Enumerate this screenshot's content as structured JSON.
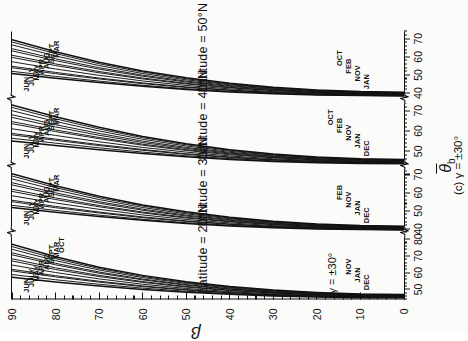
{
  "figure": {
    "caption": "(c)  γ = ±30°",
    "xaxis_title_theta": "θ",
    "xaxis_title_sub": "b",
    "yaxis_title_beta": "β",
    "gamma_note": "γ = ±30°"
  },
  "beta_axis": {
    "label": "β",
    "min": 0,
    "max": 90,
    "ticks": [
      0,
      10,
      20,
      30,
      40,
      50,
      60,
      70,
      80,
      90
    ],
    "tick_labels": [
      "0",
      "10",
      "20",
      "30",
      "40",
      "50",
      "60",
      "70",
      "80",
      "90"
    ],
    "minor_step": 2
  },
  "panels": [
    {
      "id": "panel-lat-20",
      "title": "Latitude = 20°N",
      "gamma": "γ = ±30°",
      "theta_min": 44,
      "theta_max": 84,
      "theta_ticks": [
        50,
        60,
        70,
        80
      ],
      "theta_tick_labels": [
        "50",
        "60",
        "70",
        "80"
      ],
      "theta_minor_step": 2,
      "month_labels_top": [
        "JUN",
        "JULY",
        "MAY",
        "APR",
        "AUG",
        "SEPT",
        "MAR",
        "OCT"
      ],
      "month_labels_bottom": [
        "DEC",
        "JAN",
        "NOV"
      ]
    },
    {
      "id": "panel-lat-30",
      "title": "Latitude = 30°N",
      "theta_min": 38,
      "theta_max": 75,
      "theta_ticks": [
        40,
        50,
        60,
        70
      ],
      "theta_tick_labels": [
        "40",
        "50",
        "60",
        "70"
      ],
      "theta_minor_step": 2,
      "month_labels_top": [
        "JUN",
        "JULY",
        "MAY",
        "APR",
        "AUG",
        "SEPT",
        "MAR"
      ],
      "month_labels_bottom": [
        "DEC",
        "JAN",
        "NOV",
        "FEB"
      ]
    },
    {
      "id": "panel-lat-40",
      "title": "Latitude = 40°N",
      "theta_min": 43,
      "theta_max": 76,
      "theta_ticks": [
        50,
        60,
        70
      ],
      "theta_tick_labels": [
        "50",
        "60",
        "70"
      ],
      "theta_minor_step": 2,
      "month_labels_top": [
        "JUN",
        "JULY",
        "MAY",
        "APR",
        "AUG",
        "SEPT",
        "MAR"
      ],
      "month_labels_bottom": [
        "DEC",
        "JAN",
        "NOV",
        "FEB",
        "OCT"
      ]
    },
    {
      "id": "panel-lat-50",
      "title": "Latitude = 50°N",
      "theta_min": 37,
      "theta_max": 74,
      "theta_ticks": [
        40,
        50,
        60,
        70
      ],
      "theta_tick_labels": [
        "40",
        "50",
        "60",
        "70"
      ],
      "theta_minor_step": 2,
      "month_labels_top": [
        "JUN",
        "JULY",
        "MAY",
        "APR",
        "AUG",
        "SEPT",
        "MAR"
      ],
      "month_labels_bottom": [
        "JAN",
        "NOV",
        "FEB",
        "OCT"
      ]
    }
  ],
  "chart_data": {
    "type": "line",
    "subtitle": "(c)  γ = ±30°",
    "xlabel": "θ̄b",
    "ylabel": "β",
    "ylim": [
      0,
      90
    ],
    "grid": false,
    "legend": "inline month annotations on curves",
    "note": "Four stacked sub-panels (latitudes 20°N, 30°N, 40°N, 50°N); each sub-panel has its own broken θ̄b scale. Each panel contains 12 monthly curves of θ̄b vs β for β = 0–90°.",
    "beta": [
      0,
      10,
      20,
      30,
      40,
      50,
      60,
      70,
      80,
      90
    ],
    "panels": [
      {
        "name": "Latitude = 20°N",
        "xlim": [
          44,
          84
        ],
        "series": [
          {
            "name": "JUN",
            "values": [
              47.0,
              47.3,
              48.2,
              49.6,
              51.7,
              54.6,
              58.4,
              63.3,
              69.5,
              77.0
            ]
          },
          {
            "name": "JULY",
            "values": [
              46.8,
              47.1,
              47.9,
              49.3,
              51.3,
              54.1,
              57.8,
              62.5,
              68.4,
              75.6
            ]
          },
          {
            "name": "MAY",
            "values": [
              46.6,
              46.9,
              47.7,
              49.0,
              50.9,
              53.6,
              57.1,
              61.6,
              67.2,
              74.0
            ]
          },
          {
            "name": "APR",
            "values": [
              46.4,
              46.7,
              47.4,
              48.6,
              50.4,
              52.9,
              56.2,
              60.4,
              65.6,
              71.9
            ]
          },
          {
            "name": "AUG",
            "values": [
              46.2,
              46.5,
              47.2,
              48.4,
              50.1,
              52.5,
              55.7,
              59.7,
              64.7,
              70.7
            ]
          },
          {
            "name": "SEPT",
            "values": [
              46.0,
              46.2,
              46.9,
              48.0,
              49.6,
              51.8,
              54.7,
              58.4,
              62.9,
              68.3
            ]
          },
          {
            "name": "MAR",
            "values": [
              45.9,
              46.1,
              46.7,
              47.8,
              49.3,
              51.4,
              54.2,
              57.7,
              61.9,
              67.0
            ]
          },
          {
            "name": "OCT",
            "values": [
              45.6,
              45.8,
              46.4,
              47.3,
              48.7,
              50.6,
              53.1,
              56.3,
              60.1,
              64.6
            ]
          },
          {
            "name": "NOV",
            "values": [
              45.4,
              45.6,
              46.1,
              46.9,
              48.2,
              49.9,
              52.1,
              54.9,
              58.2,
              62.0
            ]
          },
          {
            "name": "FEB",
            "values": [
              45.3,
              45.5,
              46.0,
              46.8,
              48.0,
              49.6,
              51.7,
              54.4,
              57.5,
              61.1
            ]
          },
          {
            "name": "JAN",
            "values": [
              45.1,
              45.3,
              45.7,
              46.4,
              47.5,
              48.9,
              50.8,
              53.1,
              55.8,
              58.9
            ]
          },
          {
            "name": "DEC",
            "values": [
              45.0,
              45.1,
              45.5,
              46.1,
              47.1,
              48.4,
              50.0,
              52.1,
              54.5,
              57.3
            ]
          }
        ]
      },
      {
        "name": "Latitude = 30°N",
        "xlim": [
          38,
          75
        ],
        "series": [
          {
            "name": "JUN",
            "values": [
              41.5,
              41.8,
              42.7,
              44.2,
              46.4,
              49.4,
              53.2,
              58.0,
              63.8,
              70.5
            ]
          },
          {
            "name": "JULY",
            "values": [
              41.3,
              41.6,
              42.5,
              43.9,
              46.0,
              48.9,
              52.6,
              57.2,
              62.8,
              69.2
            ]
          },
          {
            "name": "MAY",
            "values": [
              41.1,
              41.4,
              42.2,
              43.6,
              45.6,
              48.3,
              51.8,
              56.2,
              61.5,
              67.6
            ]
          },
          {
            "name": "APR",
            "values": [
              40.9,
              41.2,
              41.9,
              43.2,
              45.1,
              47.6,
              50.9,
              55.0,
              59.9,
              65.5
            ]
          },
          {
            "name": "AUG",
            "values": [
              40.7,
              41.0,
              41.7,
              42.9,
              44.7,
              47.1,
              50.3,
              54.2,
              58.9,
              64.3
            ]
          },
          {
            "name": "SEPT",
            "values": [
              40.5,
              40.7,
              41.4,
              42.5,
              44.2,
              46.4,
              49.3,
              52.9,
              57.1,
              61.9
            ]
          },
          {
            "name": "MAR",
            "values": [
              40.3,
              40.6,
              41.2,
              42.3,
              43.9,
              46.0,
              48.8,
              52.2,
              56.2,
              60.7
            ]
          },
          {
            "name": "OCT",
            "values": [
              40.1,
              40.3,
              40.9,
              41.8,
              43.3,
              45.2,
              47.7,
              50.8,
              54.3,
              58.3
            ]
          },
          {
            "name": "NOV",
            "values": [
              39.9,
              40.1,
              40.6,
              41.4,
              42.7,
              44.4,
              46.6,
              49.3,
              52.4,
              55.8
            ]
          },
          {
            "name": "FEB",
            "values": [
              39.7,
              39.9,
              40.4,
              41.2,
              42.5,
              44.1,
              46.2,
              48.8,
              51.7,
              55.0
            ]
          },
          {
            "name": "JAN",
            "values": [
              39.5,
              39.7,
              40.1,
              40.9,
              42.0,
              43.4,
              45.3,
              47.6,
              50.2,
              53.0
            ]
          },
          {
            "name": "DEC",
            "values": [
              39.4,
              39.6,
              40.0,
              40.6,
              41.6,
              43.0,
              44.7,
              46.8,
              49.2,
              51.8
            ]
          }
        ]
      },
      {
        "name": "Latitude = 40°N",
        "xlim": [
          43,
          76
        ],
        "series": [
          {
            "name": "JUN",
            "values": [
              46.0,
              46.3,
              47.2,
              48.7,
              50.8,
              53.7,
              57.3,
              61.8,
              67.0,
              72.8
            ]
          },
          {
            "name": "JULY",
            "values": [
              45.8,
              46.1,
              47.0,
              48.4,
              50.5,
              53.2,
              56.7,
              61.0,
              66.0,
              71.6
            ]
          },
          {
            "name": "MAY",
            "values": [
              45.6,
              45.9,
              46.7,
              48.1,
              50.0,
              52.6,
              55.9,
              60.0,
              64.7,
              70.0
            ]
          },
          {
            "name": "APR",
            "values": [
              45.4,
              45.7,
              46.4,
              47.7,
              49.5,
              51.9,
              55.0,
              58.8,
              63.1,
              68.0
            ]
          },
          {
            "name": "AUG",
            "values": [
              45.2,
              45.5,
              46.2,
              47.4,
              49.1,
              51.4,
              54.3,
              57.9,
              62.0,
              66.7
            ]
          },
          {
            "name": "SEPT",
            "values": [
              45.0,
              45.2,
              45.9,
              47.0,
              48.7,
              50.8,
              53.5,
              56.8,
              60.5,
              64.6
            ]
          },
          {
            "name": "MAR",
            "values": [
              44.8,
              45.0,
              45.7,
              46.8,
              48.3,
              50.4,
              53.0,
              56.2,
              59.7,
              63.6
            ]
          },
          {
            "name": "OCT",
            "values": [
              44.6,
              44.8,
              45.4,
              46.3,
              47.7,
              49.6,
              51.9,
              54.7,
              57.8,
              61.1
            ]
          },
          {
            "name": "NOV",
            "values": [
              44.4,
              44.6,
              45.1,
              45.9,
              47.2,
              48.8,
              50.9,
              53.3,
              56.0,
              58.8
            ]
          },
          {
            "name": "FEB",
            "values": [
              44.2,
              44.4,
              44.9,
              45.7,
              46.9,
              48.5,
              50.5,
              52.8,
              55.4,
              58.1
            ]
          },
          {
            "name": "JAN",
            "values": [
              44.0,
              44.2,
              44.6,
              45.3,
              46.4,
              47.8,
              49.6,
              51.7,
              54.0,
              56.4
            ]
          },
          {
            "name": "DEC",
            "values": [
              43.9,
              44.0,
              44.4,
              45.0,
              46.0,
              47.3,
              48.9,
              50.8,
              52.9,
              55.1
            ]
          }
        ]
      },
      {
        "name": "Latitude = 50°N",
        "xlim": [
          37,
          74
        ],
        "series": [
          {
            "name": "JUN",
            "values": [
              40.5,
              40.8,
              41.7,
              43.2,
              45.4,
              48.4,
              52.2,
              57.0,
              62.8,
              69.5
            ]
          },
          {
            "name": "JULY",
            "values": [
              40.3,
              40.6,
              41.5,
              42.9,
              45.0,
              47.9,
              51.6,
              56.2,
              61.8,
              68.2
            ]
          },
          {
            "name": "MAY",
            "values": [
              40.1,
              40.4,
              41.2,
              42.6,
              44.6,
              47.3,
              50.8,
              55.2,
              60.5,
              66.6
            ]
          },
          {
            "name": "APR",
            "values": [
              39.9,
              40.2,
              40.9,
              42.2,
              44.1,
              46.6,
              49.9,
              54.0,
              58.9,
              64.5
            ]
          },
          {
            "name": "AUG",
            "values": [
              39.7,
              40.0,
              40.7,
              41.9,
              43.7,
              46.1,
              49.3,
              53.2,
              57.9,
              63.3
            ]
          },
          {
            "name": "SEPT",
            "values": [
              39.5,
              39.7,
              40.4,
              41.5,
              43.2,
              45.4,
              48.3,
              51.9,
              56.1,
              60.9
            ]
          },
          {
            "name": "MAR",
            "values": [
              39.3,
              39.6,
              40.2,
              41.3,
              42.9,
              45.0,
              47.8,
              51.2,
              55.2,
              59.7
            ]
          },
          {
            "name": "OCT",
            "values": [
              39.1,
              39.3,
              39.9,
              40.8,
              42.3,
              44.2,
              46.7,
              49.8,
              53.3,
              57.3
            ]
          },
          {
            "name": "NOV",
            "values": [
              38.9,
              39.1,
              39.6,
              40.4,
              41.7,
              43.4,
              45.6,
              48.3,
              51.4,
              54.8
            ]
          },
          {
            "name": "FEB",
            "values": [
              38.7,
              38.9,
              39.4,
              40.2,
              41.5,
              43.1,
              45.2,
              47.8,
              50.7,
              54.0
            ]
          },
          {
            "name": "JAN",
            "values": [
              38.5,
              38.7,
              39.1,
              39.9,
              41.0,
              42.4,
              44.3,
              46.6,
              49.2,
              52.0
            ]
          },
          {
            "name": "DEC",
            "values": [
              38.4,
              38.6,
              39.0,
              39.6,
              40.6,
              42.0,
              43.7,
              45.8,
              48.2,
              50.8
            ]
          }
        ]
      }
    ]
  }
}
